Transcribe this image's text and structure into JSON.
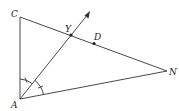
{
  "diagram": {
    "type": "geometry",
    "points": {
      "C": {
        "label": "C",
        "x": 20,
        "y": 17
      },
      "A": {
        "label": "A",
        "x": 20,
        "y": 99
      },
      "N": {
        "label": "N",
        "x": 167,
        "y": 71
      },
      "Y": {
        "label": "Y",
        "x": 71,
        "y": 35
      },
      "D": {
        "label": "D",
        "x": 94,
        "y": 43
      }
    },
    "segments": [
      {
        "from": "C",
        "to": "A"
      },
      {
        "from": "C",
        "to": "N"
      },
      {
        "from": "A",
        "to": "N"
      }
    ],
    "rays": [
      {
        "from": "A",
        "through": "Y",
        "arrow": true
      }
    ],
    "angle_marks": [
      {
        "vertex": "A",
        "between": [
          "C",
          "Y"
        ],
        "ticks": 1
      },
      {
        "vertex": "A",
        "between": [
          "Y",
          "N"
        ],
        "ticks": 1
      }
    ],
    "colors": {
      "line": "#333333",
      "text": "#222222",
      "background": "#ffffff"
    }
  }
}
